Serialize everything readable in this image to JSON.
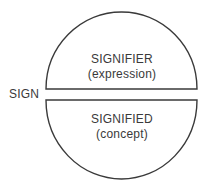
{
  "diagram": {
    "sign_label": "SIGN",
    "upper": {
      "title": "SIGNIFIER",
      "subtitle": "(expression)"
    },
    "lower": {
      "title": "SIGNIFIED",
      "subtitle": "(concept)"
    },
    "stroke_color": "#3a3a3a",
    "text_color": "#3a3a3a"
  }
}
